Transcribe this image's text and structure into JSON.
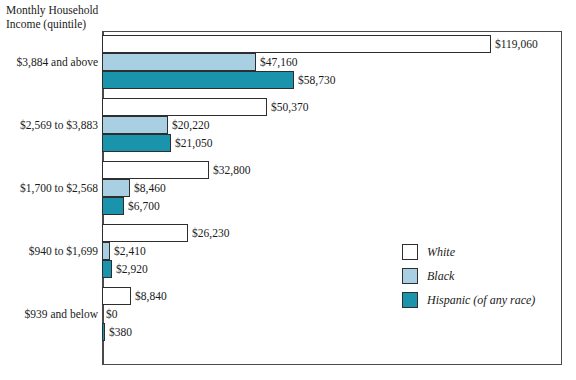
{
  "chart_data": {
    "type": "bar",
    "orientation": "horizontal",
    "title": "Monthly Household\nIncome (quintile)",
    "xlabel": "",
    "ylabel": "Monthly Household Income (quintile)",
    "grid": false,
    "legend_position": "inside-right",
    "xlim": [
      0,
      119060
    ],
    "categories": [
      "$3,884 and above",
      "$2,569 to $3,883",
      "$1,700 to $2,568",
      "$940 to $1,699",
      "$939 and below"
    ],
    "series": [
      {
        "name": "White",
        "color": "#ffffff",
        "values": [
          119060,
          50370,
          32800,
          26230,
          8840
        ],
        "labels": [
          "$119,060",
          "$50,370",
          "$32,800",
          "$26,230",
          "$8,840"
        ]
      },
      {
        "name": "Black",
        "color": "#a9d0e2",
        "values": [
          47160,
          20220,
          8460,
          2410,
          0
        ],
        "labels": [
          "$47,160",
          "$20,220",
          "$8,460",
          "$2,410",
          "$0"
        ]
      },
      {
        "name": "Hispanic (of any race)",
        "color": "#1a93ad",
        "values": [
          58730,
          21050,
          6700,
          2920,
          380
        ],
        "labels": [
          "$58,730",
          "$21,050",
          "$6,700",
          "$2,920",
          "$380"
        ]
      }
    ]
  },
  "legend": {
    "items": [
      {
        "label": "White",
        "color": "#ffffff"
      },
      {
        "label": "Black",
        "color": "#a9d0e2"
      },
      {
        "label": "Hispanic (of any race)",
        "color": "#1a93ad"
      }
    ]
  },
  "colors": {
    "white_series": "#ffffff",
    "black_series": "#a9d0e2",
    "hispanic_series": "#1a93ad",
    "outline": "#2e2e2e",
    "axis": "#4a4a4a",
    "text": "#1a1a1a"
  }
}
